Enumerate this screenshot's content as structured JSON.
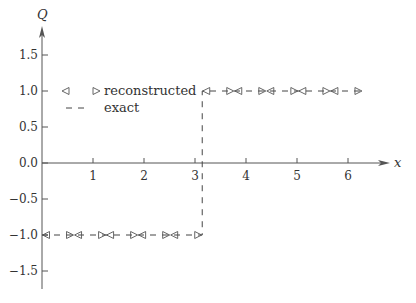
{
  "chart_data": {
    "type": "line",
    "title": "",
    "xlabel": "x",
    "ylabel": "Q",
    "xlim": [
      0,
      6.6
    ],
    "ylim": [
      -1.75,
      2.0
    ],
    "x_ticks": [
      1,
      2,
      3,
      4,
      5,
      6
    ],
    "x_tick_labels": [
      "1",
      "2",
      "3",
      "4",
      "5",
      "6"
    ],
    "y_ticks": [
      1.5,
      1.0,
      0.5,
      0.0,
      -0.5,
      -1.0,
      -1.5
    ],
    "y_tick_labels": [
      "1.5",
      "1.0",
      "0.5",
      "0.0",
      "-0.5",
      "-1.0",
      "-1.5"
    ],
    "grid": false,
    "legend_position": "upper left",
    "legend": [
      {
        "label": "reconstructed",
        "style": "triangle markers (left/right)"
      },
      {
        "label": "exact",
        "style": "dashed line"
      }
    ],
    "series": [
      {
        "name": "exact",
        "style": "dashed",
        "x": [
          0,
          3.1416,
          3.1416,
          6.2832
        ],
        "y": [
          -1.0,
          -1.0,
          1.0,
          1.0
        ]
      },
      {
        "name": "reconstructed",
        "style": "markers",
        "cells": [
          {
            "x_left": 0.0,
            "x_right": 0.6283,
            "left_value": -1.0,
            "right_value": -1.0
          },
          {
            "x_left": 0.6283,
            "x_right": 1.2566,
            "left_value": -1.0,
            "right_value": -1.0
          },
          {
            "x_left": 1.2566,
            "x_right": 1.885,
            "left_value": -1.0,
            "right_value": -1.0
          },
          {
            "x_left": 1.885,
            "x_right": 2.5133,
            "left_value": -1.0,
            "right_value": -1.0
          },
          {
            "x_left": 2.5133,
            "x_right": 3.1416,
            "left_value": -1.0,
            "right_value": -1.0
          },
          {
            "x_left": 3.1416,
            "x_right": 3.7699,
            "left_value": 1.0,
            "right_value": 1.0
          },
          {
            "x_left": 3.7699,
            "x_right": 4.3982,
            "left_value": 1.0,
            "right_value": 1.0
          },
          {
            "x_left": 4.3982,
            "x_right": 5.0265,
            "left_value": 1.0,
            "right_value": 1.0
          },
          {
            "x_left": 5.0265,
            "x_right": 5.6549,
            "left_value": 1.0,
            "right_value": 1.0
          },
          {
            "x_left": 5.6549,
            "x_right": 6.2832,
            "left_value": 1.0,
            "right_value": 1.0
          }
        ]
      }
    ]
  },
  "colors": {
    "axis": "#555555",
    "line": "#444444",
    "marker": "#555555"
  }
}
